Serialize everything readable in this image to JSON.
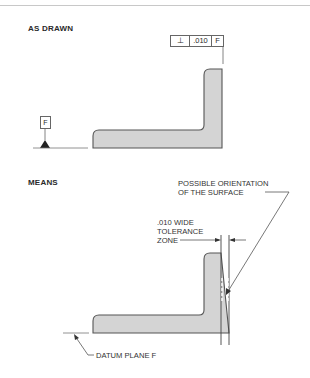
{
  "figure": {
    "top_rule": true,
    "sections": [
      {
        "heading": "AS DRAWN",
        "feature_control_frame": {
          "symbol": "⊥",
          "symbol_name": "perpendicularity",
          "tolerance": ".010",
          "datum": "F"
        },
        "datum_feature_symbol": "F"
      },
      {
        "heading": "MEANS",
        "callouts": {
          "orientation_line1": "POSSIBLE ORIENTATION",
          "orientation_line2": "OF THE SURFACE",
          "zone_line1": ".010 WIDE",
          "zone_line2": "TOLERANCE",
          "zone_line3": "ZONE",
          "datum_plane": "DATUM PLANE F"
        }
      }
    ],
    "colors": {
      "part_fill": "#d4d4d4",
      "part_outline": "#555555",
      "line": "#555555"
    }
  }
}
